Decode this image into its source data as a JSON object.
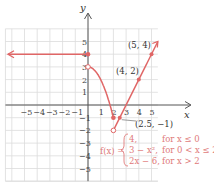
{
  "chart_data": {
    "type": "line",
    "title": "",
    "xlabel": "x",
    "ylabel": "y",
    "xlim": [
      -6.5,
      5.5
    ],
    "ylim": [
      -6,
      6
    ],
    "grid": true,
    "x_ticks": [
      "-5",
      "-4",
      "-3",
      "-2",
      "-1",
      "1",
      "2",
      "3",
      "4",
      "5"
    ],
    "y_ticks": [
      "-5",
      "-4",
      "-3",
      "-2",
      "-1",
      "1",
      "2",
      "3",
      "4",
      "5"
    ],
    "series": [
      {
        "name": "f(x) = 4, for x ≤ 0",
        "kind": "ray-left",
        "points": [
          [
            -6.5,
            4
          ],
          [
            0,
            4
          ]
        ],
        "endpoint": {
          "x": 0,
          "y": 4,
          "closed": true
        }
      },
      {
        "name": "f(x) = 3 − x², for 0 < x ≤ 2",
        "kind": "curve",
        "points": [
          [
            0,
            3
          ],
          [
            0.5,
            2.75
          ],
          [
            1,
            2
          ],
          [
            1.5,
            0.75
          ],
          [
            2,
            -1
          ]
        ],
        "open_start": {
          "x": 0,
          "y": 3
        },
        "closed_end": {
          "x": 2,
          "y": -1
        }
      },
      {
        "name": "f(x) = 2x − 6, for x > 2",
        "kind": "ray-right",
        "points": [
          [
            2,
            -2
          ],
          [
            5.5,
            5
          ]
        ],
        "open_start": {
          "x": 2,
          "y": -2
        }
      }
    ],
    "labeled_points": [
      {
        "label": "(5, 4)",
        "x": 5,
        "y": 4
      },
      {
        "label": "(4, 2)",
        "x": 4,
        "y": 2
      },
      {
        "label": "(2.5, −1)",
        "x": 2.5,
        "y": -1
      }
    ],
    "annotations": {
      "function_name": "f(x) =",
      "cases": [
        {
          "expr": "4,",
          "cond": "for x ≤ 0"
        },
        {
          "expr": "3 − x²,",
          "cond": "for 0 < x ≤ 2"
        },
        {
          "expr": "2x − 6,",
          "cond": "for x > 2"
        }
      ]
    },
    "colors": {
      "curve": "#e06666",
      "grid": "#d9d9d9",
      "axis": "#555555",
      "text": "#e07a7a"
    }
  },
  "labels": {
    "x_axis": "x",
    "y_axis": "y",
    "p54": "(5, 4)",
    "p42": "(4, 2)",
    "p251": "(2.5, −1)",
    "fname": "f(x) =",
    "case1_expr": "4,",
    "case1_cond": "for x ≤ 0",
    "case2_expr": "3 − x²,",
    "case2_cond": "for 0 < x ≤ 2",
    "case3_expr": "2x − 6,",
    "case3_cond": "for x > 2"
  }
}
